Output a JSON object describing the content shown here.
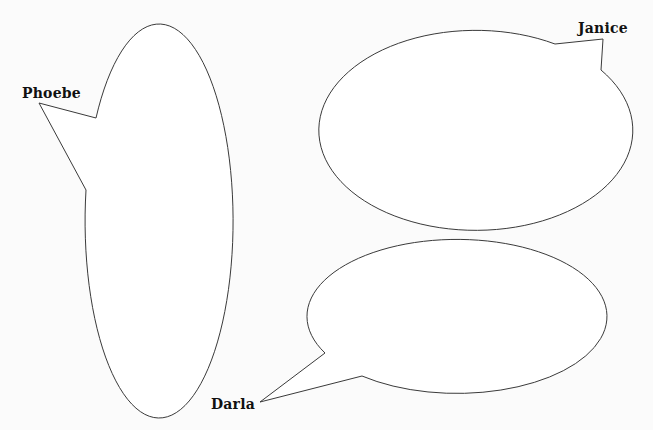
{
  "diagram": {
    "type": "speech-bubbles",
    "colors": {
      "background": "#fbfbfb",
      "bubble_fill": "#ffffff",
      "bubble_stroke": "#3a3a3a",
      "label_text": "#111111"
    },
    "bubbles": [
      {
        "speaker": "Phoebe",
        "shape": "vertical-ellipse",
        "tail_direction": "upper-left",
        "text": ""
      },
      {
        "speaker": "Janice",
        "shape": "horizontal-ellipse",
        "tail_direction": "upper-right",
        "text": ""
      },
      {
        "speaker": "Darla",
        "shape": "horizontal-ellipse",
        "tail_direction": "lower-left",
        "text": ""
      }
    ]
  }
}
